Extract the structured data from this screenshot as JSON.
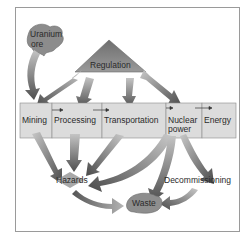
{
  "diagram": {
    "source_node": "Uranium ore",
    "source_lines": [
      "Uranium",
      "ore"
    ],
    "regulation": "Regulation",
    "stages": [
      "Mining",
      "Processing",
      "Transportation",
      "Nuclear power",
      "Energy"
    ],
    "nuclear_lines": [
      "Nuclear",
      "power"
    ],
    "hazards": "Hazards",
    "decommissioning": "Decommissioning",
    "waste": "Waste",
    "colors": {
      "shape_fill": "#8e8e8e",
      "box_fill": "#dcdcdc",
      "box_border": "#8a8a8a",
      "arrow_dark": "#5a5a5a",
      "arrow_light": "#b0b0b0",
      "text": "#2a2a2a"
    }
  }
}
